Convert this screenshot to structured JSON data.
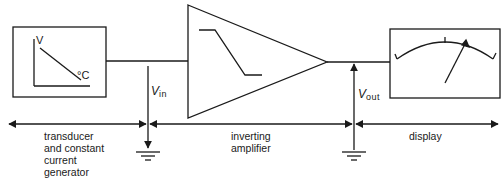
{
  "diagram": {
    "type": "block-diagram",
    "title": "",
    "blocks": [
      {
        "id": "transducer",
        "label": "transducer and constant current generator",
        "label_lines": [
          "transducer",
          "and constant",
          "current",
          "generator"
        ],
        "inner_graph": {
          "y_axis": "V",
          "x_axis": "°C",
          "trend": "decreasing"
        }
      },
      {
        "id": "amplifier",
        "label": "inverting amplifier",
        "label_lines": [
          "inverting",
          "amplifier"
        ],
        "symbol": "triangle-op-amp",
        "inner_graph": "step-down transfer curve"
      },
      {
        "id": "display",
        "label": "display",
        "label_lines": [
          "display"
        ],
        "symbol": "analog-meter"
      }
    ],
    "signals": [
      {
        "name": "V",
        "sub": "in",
        "between": [
          "transducer",
          "amplifier"
        ]
      },
      {
        "name": "V",
        "sub": "out",
        "between": [
          "amplifier",
          "display"
        ]
      }
    ],
    "grounds": 2,
    "colors": {
      "line": "#1a1a1a",
      "background": "#ffffff"
    }
  }
}
